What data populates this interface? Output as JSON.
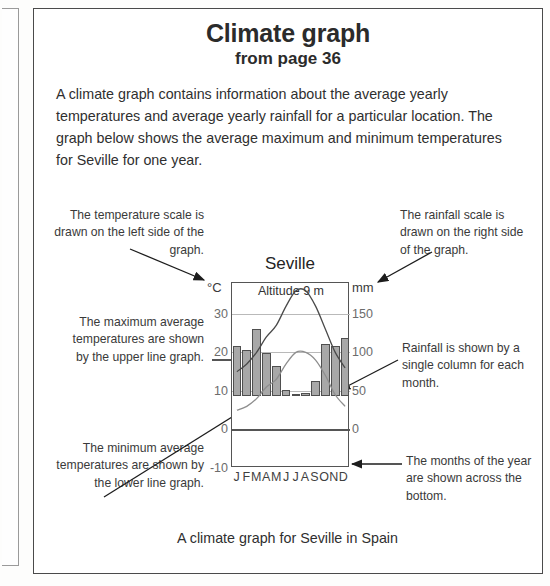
{
  "title": {
    "main": "Climate graph",
    "sub": "from page 36"
  },
  "intro": "A climate graph contains information about the average yearly temperatures and average yearly rainfall for a particular location. The graph below shows the average maximum and minimum temperatures for Seville for one year.",
  "annotations": {
    "temperature_scale": "The temperature scale is drawn on the left side of the graph.",
    "rainfall_scale": "The rainfall scale is drawn on the right side of the graph.",
    "maximum": "The maximum average temperatures are shown by the upper line graph.",
    "minimum": "The minimum average temperatures are shown by the lower line graph.",
    "rainfall_column": "Rainfall is shown by a single column for each month.",
    "months": "The months of the year are shown across the bottom."
  },
  "caption": "A climate graph for Seville in Spain",
  "chart_data": {
    "type": "bar",
    "title": "Seville",
    "subtitle": "Altitude 9 m",
    "categories": [
      "J",
      "F",
      "M",
      "A",
      "M",
      "J",
      "J",
      "A",
      "S",
      "O",
      "N",
      "D"
    ],
    "left_axis": {
      "unit": "°C",
      "label": "°C",
      "ticks": [
        30,
        20,
        10,
        0,
        -10
      ],
      "ylim": [
        -10,
        38
      ]
    },
    "right_axis": {
      "unit": "mm",
      "label": "mm",
      "ticks": [
        150,
        100,
        50,
        0
      ],
      "ylim": [
        0,
        190
      ]
    },
    "grid": true,
    "legend": "none",
    "series": [
      {
        "name": "Rainfall",
        "type": "bar",
        "axis": "right",
        "unit": "mm",
        "values": [
          66,
          60,
          88,
          56,
          40,
          8,
          1,
          4,
          20,
          68,
          66,
          76
        ]
      },
      {
        "name": "Average maximum temperature",
        "type": "line",
        "axis": "left",
        "unit": "°C",
        "values": [
          15,
          17,
          20,
          24,
          27,
          32,
          36,
          36,
          32,
          26,
          20,
          16
        ]
      },
      {
        "name": "Average minimum temperature",
        "type": "line",
        "axis": "left",
        "unit": "°C",
        "values": [
          5,
          6,
          8,
          11,
          13,
          17,
          20,
          20,
          18,
          14,
          9,
          6
        ]
      }
    ]
  }
}
